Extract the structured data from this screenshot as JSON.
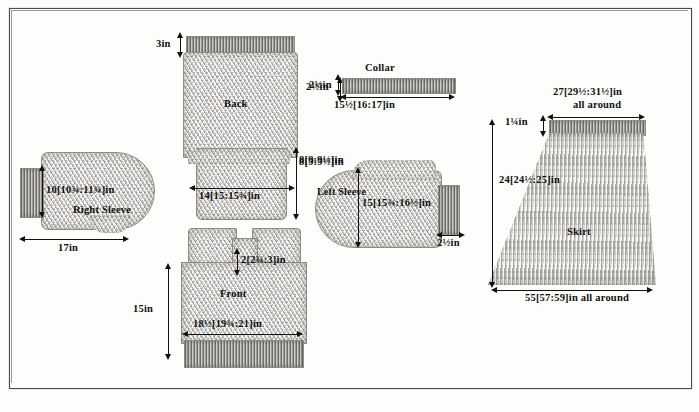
{
  "document": {
    "type": "knitting-pattern-schematic",
    "description": "Garment schematic diagram showing pattern pieces with measurements in inches"
  },
  "pieces": {
    "back": {
      "name": "Back",
      "top_rib_height": "3in",
      "shoulder_dim": "2½in",
      "armhole_dim": "8[9:9½]in",
      "width": "14[15:15¾]in"
    },
    "collar": {
      "name": "Collar",
      "height": "2½in",
      "width": "15½[16:17]in"
    },
    "right_sleeve": {
      "name": "Right Sleeve",
      "height": "10[10¾:11¾]in",
      "width": "17in"
    },
    "left_sleeve": {
      "name": "Left Sleeve",
      "top_dim": "8[9:9½]in",
      "height": "15[15¾:16½]in",
      "cuff_dim": "2½in"
    },
    "front": {
      "name": "Front",
      "neck_dim": "2[2¾:3]in",
      "height": "15in",
      "width": "18½[19¾:21]in"
    },
    "skirt": {
      "name": "Skirt",
      "top_width": "27[29½:31½]in",
      "top_width_note": "all around",
      "waistband_height": "1¼in",
      "length": "24[24½:25]in",
      "hem_width": "55[57:59]in all around"
    }
  },
  "colors": {
    "ink": "#111111",
    "fabric": "#d8d6d2",
    "rib": "#b9b7b3",
    "border": "#4a4a4a"
  }
}
